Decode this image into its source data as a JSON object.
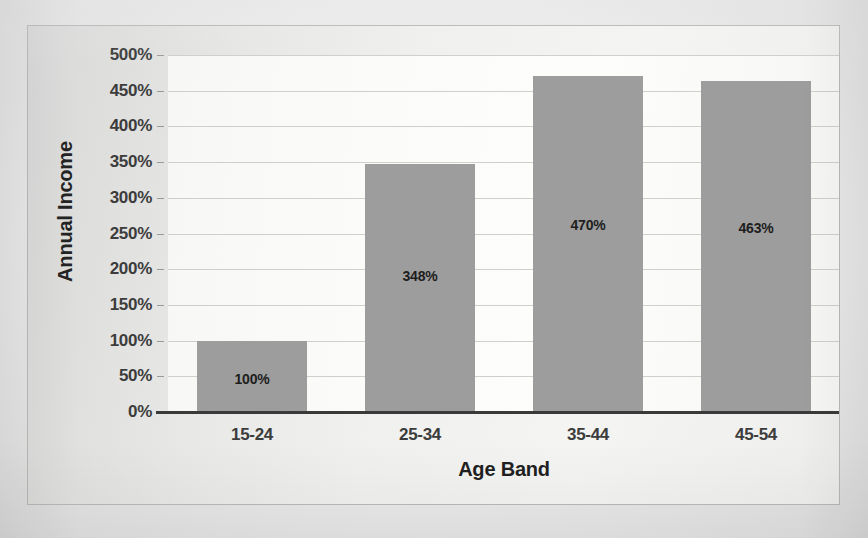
{
  "chart_data": {
    "type": "bar",
    "title": "",
    "categories": [
      "15-24",
      "25-34",
      "35-44",
      "45-54"
    ],
    "values": [
      100,
      348,
      470,
      463
    ],
    "data_labels": [
      "100%",
      "348%",
      "470%",
      "463%"
    ],
    "xlabel": "Age Band",
    "ylabel": "Annual Income",
    "ylim": [
      0,
      500
    ],
    "ytick_step": 50,
    "ytick_labels": [
      "0%",
      "50%",
      "100%",
      "150%",
      "200%",
      "250%",
      "300%",
      "350%",
      "400%",
      "450%",
      "500%"
    ],
    "ytick_values": [
      0,
      50,
      100,
      150,
      200,
      250,
      300,
      350,
      400,
      450,
      500
    ],
    "grid": true,
    "legend": false,
    "series_color": "#9d9d9d",
    "axis_color": "#3a3a3a",
    "gridline_color": "#cfcfcb",
    "plot_background": "#fbfbfa",
    "frame_background": "#ececea"
  }
}
